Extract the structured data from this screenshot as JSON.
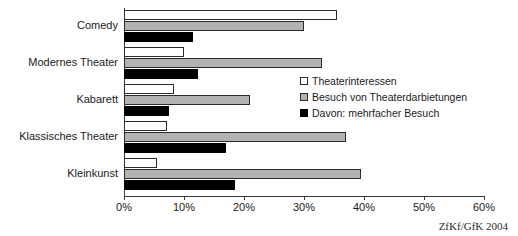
{
  "chart_data": {
    "type": "bar",
    "orientation": "horizontal",
    "title": "",
    "xlabel": "",
    "ylabel": "",
    "xlim": [
      0,
      60
    ],
    "xtick_labels": [
      "0%",
      "10%",
      "20%",
      "30%",
      "40%",
      "50%",
      "60%"
    ],
    "xtick_values": [
      0,
      10,
      20,
      30,
      40,
      50,
      60
    ],
    "grid": false,
    "legend_position": "center-right",
    "categories": [
      "Comedy",
      "Modernes Theater",
      "Kabarett",
      "Klassisches Theater",
      "Kleinkunst"
    ],
    "series": [
      {
        "name": "Theaterinteressen",
        "color": "#ffffff",
        "values": [
          35.5,
          10.0,
          8.3,
          7.2,
          5.5
        ]
      },
      {
        "name": "Besuch von Theaterdarbietungen",
        "color": "#b2b2b2",
        "values": [
          30.0,
          33.0,
          21.0,
          37.0,
          39.5
        ]
      },
      {
        "name": "Davon: mehrfacher Besuch",
        "color": "#000000",
        "values": [
          11.5,
          12.3,
          7.5,
          17.0,
          18.5
        ]
      }
    ]
  },
  "legend": {
    "items": [
      {
        "label": "Theaterinteressen"
      },
      {
        "label": "Besuch von Theaterdarbietungen"
      },
      {
        "label": "Davon: mehrfacher Besuch"
      }
    ]
  },
  "source": {
    "text": "ZfKf/GfK 2004"
  }
}
